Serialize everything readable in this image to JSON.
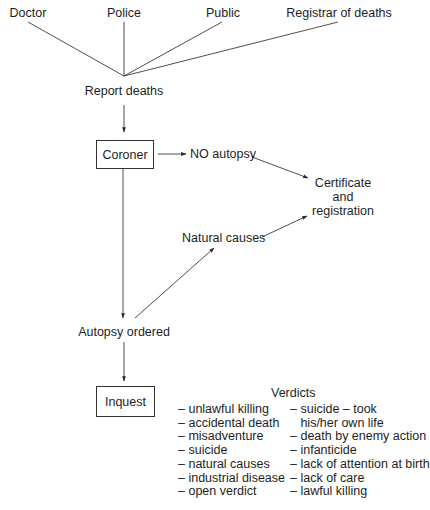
{
  "sources": {
    "doctor": "Doctor",
    "police": "Police",
    "public": "Public",
    "registrar": "Registrar of deaths"
  },
  "flow": {
    "report_deaths": "Report deaths",
    "coroner": "Coroner",
    "no_autopsy": "NO autopsy",
    "certificate_line1": "Certificate",
    "certificate_line2": "and",
    "certificate_line3": "registration",
    "natural_causes": "Natural causes",
    "autopsy_ordered": "Autopsy ordered",
    "inquest": "Inquest"
  },
  "verdicts": {
    "title": "Verdicts",
    "column1": [
      "– unlawful killing",
      "– accidental death",
      "– misadventure",
      "– suicide",
      "– natural causes",
      "– industrial disease",
      "– open verdict"
    ],
    "column2": [
      "– suicide – took",
      "   his/her own life",
      "– death by enemy action",
      "– infanticide",
      "– lack of attention at birth",
      "– lack of care",
      "– lawful killing"
    ]
  },
  "colors": {
    "line": "#3a3a3a",
    "text": "#1e1e1e"
  }
}
